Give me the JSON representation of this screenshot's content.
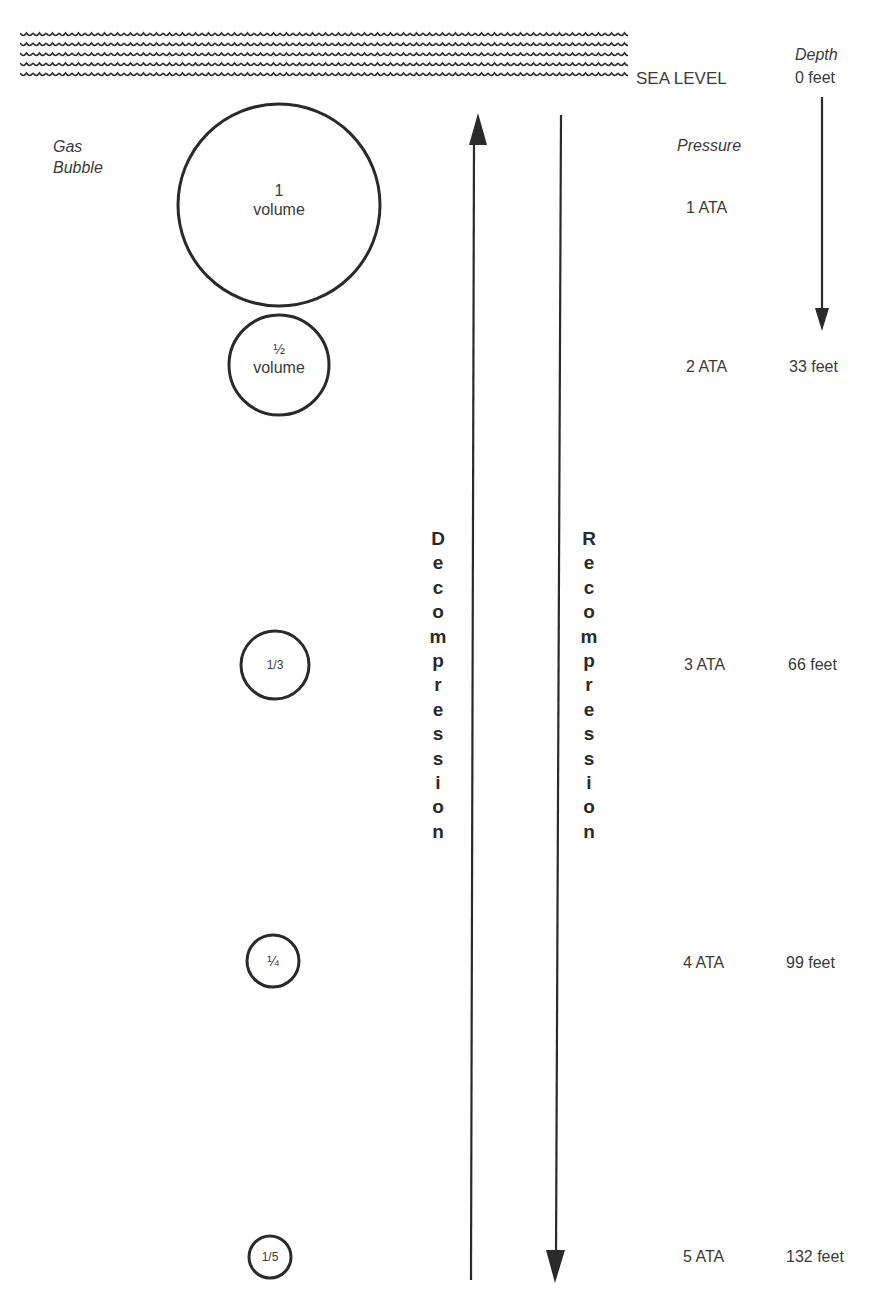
{
  "diagram": {
    "type": "depth-pressure-gas-volume",
    "surface": {
      "label": "SEA LEVEL",
      "wave_rows": 5
    },
    "left_label": {
      "line1": "Gas",
      "line2": "Bubble"
    },
    "depth_header": "Depth",
    "pressure_header": "Pressure",
    "levels": [
      {
        "pressure": "1 ATA",
        "depth": "0 feet",
        "bubble_line1": "1",
        "bubble_line2": "volume"
      },
      {
        "pressure": "2 ATA",
        "depth": "33 feet",
        "bubble_line1": "½",
        "bubble_line2": "volume"
      },
      {
        "pressure": "3 ATA",
        "depth": "66 feet",
        "bubble_line1": "1/3",
        "bubble_line2": ""
      },
      {
        "pressure": "4 ATA",
        "depth": "99 feet",
        "bubble_line1": "¼",
        "bubble_line2": ""
      },
      {
        "pressure": "5 ATA",
        "depth": "132 feet",
        "bubble_line1": "1/5",
        "bubble_line2": ""
      }
    ],
    "arrows": {
      "up_label": "Decompression",
      "down_label": "Recompression"
    },
    "colors": {
      "ink": "#2a2a2a",
      "background": "#ffffff"
    }
  }
}
